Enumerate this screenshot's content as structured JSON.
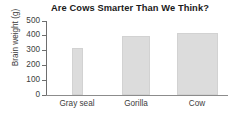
{
  "chart_data": {
    "type": "bar",
    "title": "Are Cows Smarter Than We Think?",
    "xlabel": "",
    "ylabel": "Brain weight (g)",
    "categories": [
      "Gray seal",
      "Gorilla",
      "Cow"
    ],
    "values": [
      320,
      400,
      420
    ],
    "ylim": [
      0,
      500
    ],
    "yticks": [
      "0",
      "100",
      "200",
      "300",
      "400",
      "500"
    ],
    "ytick_values": [
      0,
      100,
      200,
      300,
      400,
      500
    ],
    "grid": false,
    "legend": false,
    "bar_color": "#dcdcdc",
    "bar_border_color": "#d2d2d2",
    "axis_color": "#6e6e6e",
    "text_color": "#3d3d3d",
    "title_color": "#1a1a1a",
    "background": "#ffffff",
    "bar_widths_px": [
      11,
      28,
      41
    ],
    "bar_centers_px": [
      31,
      90,
      151
    ]
  }
}
